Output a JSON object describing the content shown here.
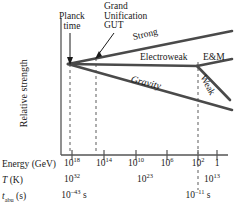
{
  "figure": {
    "ylabel": "Relative strength",
    "line_color": "#4a4a4a",
    "axis_color": "#555555",
    "text_color": "#1a1a1a"
  },
  "annotations": {
    "planck": "Planck\ntime",
    "planck_line1": "Planck",
    "planck_line2": "time",
    "gut_line1": "Grand",
    "gut_line2": "Unification",
    "gut_line3": "GUT"
  },
  "forces": [
    {
      "name": "strong",
      "label": "Strong"
    },
    {
      "name": "electroweak",
      "label": "Electroweak"
    },
    {
      "name": "em",
      "label": "E&M"
    },
    {
      "name": "weak",
      "label": "Weak"
    },
    {
      "name": "gravity",
      "label": "Gravity"
    }
  ],
  "rows": {
    "energy": {
      "label_main": "Energy (GeV)"
    },
    "temperature": {
      "label_italic": "T",
      "label_rest": " (K)"
    },
    "time": {
      "label_italic": "t",
      "label_sub": "abu",
      "label_rest": " (s)"
    }
  },
  "chart_data": {
    "type": "line",
    "title": "",
    "xlabel": "Energy (GeV)",
    "ylabel": "Relative strength",
    "grid": false,
    "legend": "inline-annotations",
    "x_axis": {
      "name": "Energy (GeV)",
      "scale": "log-decreasing",
      "tick_labels": [
        "10^18",
        "10^14",
        "10^10",
        "10^6",
        "10^2",
        "1"
      ],
      "tick_labels_display": [
        {
          "mantissa": "10",
          "exp": "18"
        },
        {
          "mantissa": "10",
          "exp": "14"
        },
        {
          "mantissa": "10",
          "exp": "10"
        },
        {
          "mantissa": "10",
          "exp": "6"
        },
        {
          "mantissa": "10",
          "exp": "2"
        },
        {
          "mantissa": "1",
          "exp": ""
        }
      ],
      "tick_x_px": [
        72,
        104,
        136,
        167,
        198,
        217
      ]
    },
    "secondary_axes": [
      {
        "name": "T (K)",
        "values": [
          {
            "mantissa": "10",
            "exp": "32",
            "x_px": 72
          },
          {
            "mantissa": "10",
            "exp": "23",
            "x_px": 145
          },
          {
            "mantissa": "10",
            "exp": "13",
            "x_px": 212
          }
        ]
      },
      {
        "name": "t_abu (s)",
        "values": [
          {
            "mantissa": "10",
            "exp": "–43",
            "suffix": " s",
            "x_px": 74
          },
          {
            "mantissa": "10",
            "exp": "–11",
            "suffix": " s",
            "x_px": 198
          }
        ]
      }
    ],
    "markers": [
      {
        "name": "Planck time",
        "x_px": 70,
        "style": "dashed-vertical-with-arrow"
      },
      {
        "name": "Grand Unification GUT",
        "x_px": 96,
        "style": "dashed-vertical-with-arrow"
      },
      {
        "name": "Electroweak split",
        "x_px": 198,
        "style": "dashed-vertical"
      }
    ],
    "series": [
      {
        "name": "Strong",
        "points": [
          [
            68,
            64
          ],
          [
            232,
            31
          ]
        ]
      },
      {
        "name": "Electroweak",
        "points": [
          [
            68,
            64
          ],
          [
            198,
            66
          ]
        ]
      },
      {
        "name": "E&M",
        "points": [
          [
            198,
            66
          ],
          [
            232,
            59
          ]
        ]
      },
      {
        "name": "Weak",
        "points": [
          [
            198,
            66
          ],
          [
            230,
            100
          ]
        ]
      },
      {
        "name": "Gravity",
        "points": [
          [
            68,
            64
          ],
          [
            232,
            110
          ]
        ]
      }
    ],
    "note": "Forces unify at high energy / early time: gravity, electroweak (E&M + weak) and strong diverge as energy drops."
  }
}
